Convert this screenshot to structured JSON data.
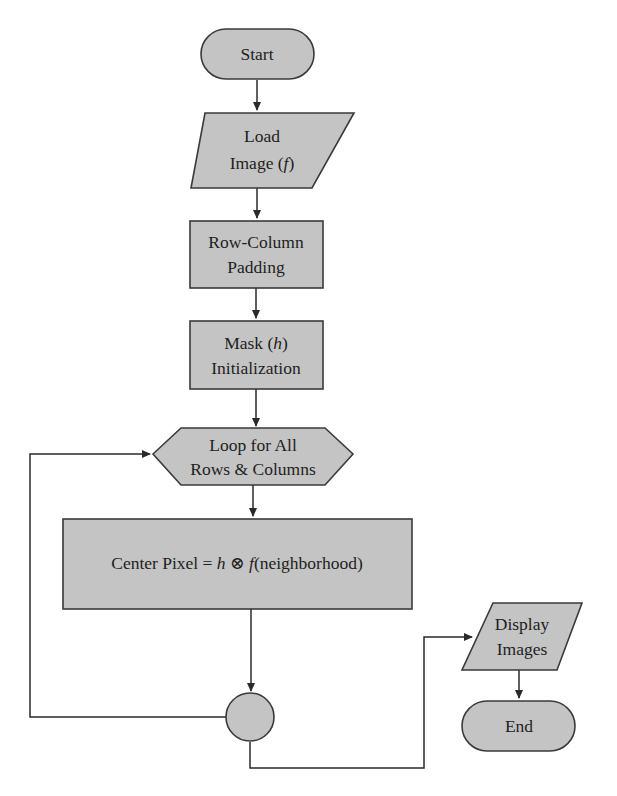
{
  "diagram": {
    "type": "flowchart",
    "colors": {
      "node_fill": "#c4c4c4",
      "node_stroke": "#3a3a3a",
      "edge": "#2a2a2a",
      "text": "#1e1e1e",
      "background": "#ffffff"
    },
    "nodes": {
      "start": {
        "shape": "terminator",
        "label": "Start"
      },
      "load_image": {
        "shape": "parallelogram",
        "line1": "Load",
        "line2_prefix": "Image (",
        "line2_var": "f",
        "line2_suffix": ")"
      },
      "padding": {
        "shape": "rectangle",
        "line1": "Row-Column",
        "line2": "Padding"
      },
      "mask_init": {
        "shape": "rectangle",
        "line1_prefix": "Mask (",
        "line1_var": "h",
        "line1_suffix": ")",
        "line2": "Initialization"
      },
      "loop": {
        "shape": "hexagon",
        "line1": "Loop for All",
        "line2": "Rows & Columns"
      },
      "center_pixel": {
        "shape": "rectangle",
        "prefix": "Center Pixel = ",
        "var_h": "h",
        "op": " ⊗ ",
        "var_f": "f",
        "suffix": "(neighborhood)"
      },
      "connector": {
        "shape": "circle",
        "label": ""
      },
      "display": {
        "shape": "parallelogram",
        "line1": "Display",
        "line2": "Images"
      },
      "end": {
        "shape": "terminator",
        "label": "End"
      }
    },
    "edges": [
      {
        "from": "start",
        "to": "load_image"
      },
      {
        "from": "load_image",
        "to": "padding"
      },
      {
        "from": "padding",
        "to": "mask_init"
      },
      {
        "from": "mask_init",
        "to": "loop"
      },
      {
        "from": "loop",
        "to": "center_pixel"
      },
      {
        "from": "center_pixel",
        "to": "connector"
      },
      {
        "from": "connector",
        "to": "loop",
        "type": "loop-back"
      },
      {
        "from": "connector",
        "to": "display"
      },
      {
        "from": "display",
        "to": "end"
      }
    ]
  }
}
